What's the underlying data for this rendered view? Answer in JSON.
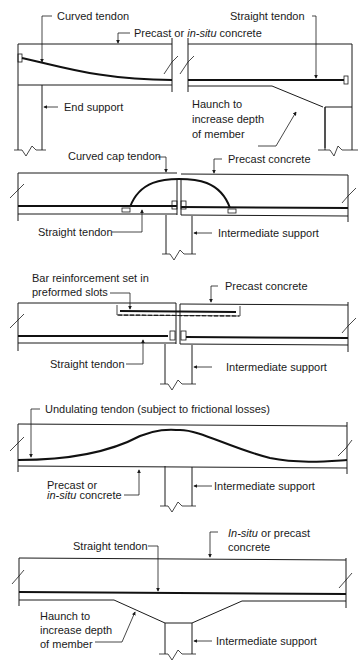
{
  "diagram": {
    "colors": {
      "ink": "#1a1a1a",
      "background": "#ffffff"
    },
    "panels": [
      {
        "id": "end-span",
        "labels": {
          "curved_tendon": "Curved tendon",
          "straight_tendon": "Straight tendon",
          "concrete_prefix": "Precast or ",
          "concrete_italic": "in-situ",
          "concrete_suffix": " concrete",
          "end_support": "End support",
          "haunch_l1": "Haunch to",
          "haunch_l2": "increase depth",
          "haunch_l3": "of member"
        }
      },
      {
        "id": "curved-cap",
        "labels": {
          "curved_cap_tendon": "Curved cap tendon",
          "precast_concrete": "Precast concrete",
          "straight_tendon": "Straight tendon",
          "intermediate_support": "Intermediate support"
        }
      },
      {
        "id": "bar-reinforcement",
        "labels": {
          "bar_l1": "Bar reinforcement set in",
          "bar_l2": "preformed slots",
          "precast_concrete": "Precast concrete",
          "straight_tendon": "Straight tendon",
          "intermediate_support": "Intermediate support"
        }
      },
      {
        "id": "undulating",
        "labels": {
          "undulating_tendon": "Undulating tendon (subject to frictional losses)",
          "concrete_l1": "Precast or",
          "concrete_italic": "in-situ",
          "concrete_suffix": " concrete",
          "intermediate_support": "Intermediate support"
        }
      },
      {
        "id": "haunched",
        "labels": {
          "straight_tendon": "Straight tendon",
          "concrete_italic": "In-situ",
          "concrete_suffix": " or precast",
          "concrete_l2": "concrete",
          "haunch_l1": "Haunch to",
          "haunch_l2": "increase depth",
          "haunch_l3": "of member",
          "intermediate_support": "Intermediate support"
        }
      }
    ]
  }
}
